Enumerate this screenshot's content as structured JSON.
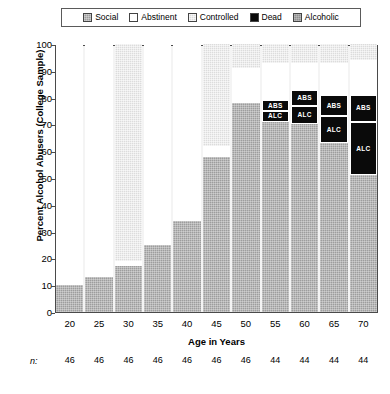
{
  "legend": {
    "items": [
      {
        "label": "Social",
        "key": "social",
        "color": "#9d9d9d"
      },
      {
        "label": "Abstinent",
        "key": "abstinent",
        "color": "#ffffff"
      },
      {
        "label": "Controlled",
        "key": "controlled",
        "color": "#dcdcdc"
      },
      {
        "label": "Dead",
        "key": "dead",
        "color": "#0a0a0a"
      },
      {
        "label": "Alcoholic",
        "key": "alcoholic",
        "color": "#8f8f8f"
      }
    ]
  },
  "axes": {
    "y_title": "Percent Alcohol Abusers (College Sample)",
    "x_title": "Age in Years",
    "y_ticks": [
      "100",
      "90",
      "80",
      "70",
      "60",
      "50",
      "40",
      "30",
      "20",
      "10",
      "0"
    ],
    "y_min": 0,
    "y_max": 100,
    "x_ticks": [
      "20",
      "25",
      "30",
      "35",
      "40",
      "45",
      "50",
      "55",
      "60",
      "65",
      "70"
    ]
  },
  "sample_sizes": {
    "prefix": "n:",
    "values": [
      "46",
      "46",
      "46",
      "46",
      "46",
      "46",
      "46",
      "44",
      "44",
      "44",
      "44"
    ]
  },
  "chart_data": {
    "type": "bar",
    "stacked": true,
    "title": "",
    "xlabel": "Age in Years",
    "ylabel": "Percent Alcohol Abusers (College Sample)",
    "ylim": [
      0,
      100
    ],
    "grid": false,
    "legend_position": "top",
    "categories": [
      "20",
      "25",
      "30",
      "35",
      "40",
      "45",
      "50",
      "55",
      "60",
      "65",
      "70"
    ],
    "series": [
      {
        "name": "Social",
        "values": [
          10,
          13,
          17,
          25,
          34,
          58,
          78,
          71,
          70,
          63,
          51
        ]
      },
      {
        "name": "Abstinent",
        "values": [
          90,
          87,
          2,
          75,
          66,
          4,
          13,
          14,
          10,
          12,
          13
        ]
      },
      {
        "name": "Controlled",
        "values": [
          0,
          0,
          81,
          0,
          0,
          38,
          9,
          7,
          7,
          7,
          6
        ]
      },
      {
        "name": "Dead (ABS)",
        "values": [
          0,
          0,
          0,
          0,
          0,
          0,
          0,
          4,
          6,
          8,
          10
        ]
      },
      {
        "name": "Dead (ALC)",
        "values": [
          0,
          0,
          0,
          0,
          0,
          0,
          0,
          4,
          7,
          10,
          20
        ]
      }
    ],
    "segment_labels": {
      "abstinent_dead": "ABS",
      "alcoholic_dead": "ALC"
    },
    "bars": [
      {
        "x": "20",
        "n": "46",
        "segments": [
          {
            "type": "social",
            "from": 0,
            "to": 10
          },
          {
            "type": "abstinent",
            "from": 10,
            "to": 100
          }
        ]
      },
      {
        "x": "25",
        "n": "46",
        "segments": [
          {
            "type": "social",
            "from": 0,
            "to": 13
          },
          {
            "type": "abstinent",
            "from": 13,
            "to": 100
          }
        ]
      },
      {
        "x": "30",
        "n": "46",
        "segments": [
          {
            "type": "social",
            "from": 0,
            "to": 17
          },
          {
            "type": "abstinent",
            "from": 17,
            "to": 19
          },
          {
            "type": "controlled",
            "from": 19,
            "to": 100
          }
        ]
      },
      {
        "x": "35",
        "n": "46",
        "segments": [
          {
            "type": "social",
            "from": 0,
            "to": 25
          },
          {
            "type": "abstinent",
            "from": 25,
            "to": 100
          }
        ]
      },
      {
        "x": "40",
        "n": "46",
        "segments": [
          {
            "type": "social",
            "from": 0,
            "to": 34
          },
          {
            "type": "abstinent",
            "from": 34,
            "to": 100
          }
        ]
      },
      {
        "x": "45",
        "n": "46",
        "segments": [
          {
            "type": "social",
            "from": 0,
            "to": 58
          },
          {
            "type": "abstinent",
            "from": 58,
            "to": 62
          },
          {
            "type": "controlled",
            "from": 62,
            "to": 100
          }
        ]
      },
      {
        "x": "50",
        "n": "46",
        "segments": [
          {
            "type": "social",
            "from": 0,
            "to": 78
          },
          {
            "type": "abstinent",
            "from": 78,
            "to": 91
          },
          {
            "type": "controlled",
            "from": 91,
            "to": 100
          }
        ]
      },
      {
        "x": "55",
        "n": "44",
        "segments": [
          {
            "type": "social",
            "from": 0,
            "to": 71
          },
          {
            "type": "dead",
            "from": 71,
            "to": 75,
            "label": "ALC"
          },
          {
            "type": "dead",
            "from": 75,
            "to": 79,
            "label": "ABS"
          },
          {
            "type": "abstinent",
            "from": 79,
            "to": 93
          },
          {
            "type": "controlled",
            "from": 93,
            "to": 100
          }
        ]
      },
      {
        "x": "60",
        "n": "44",
        "segments": [
          {
            "type": "social",
            "from": 0,
            "to": 70
          },
          {
            "type": "dead",
            "from": 70,
            "to": 77,
            "label": "ALC"
          },
          {
            "type": "dead",
            "from": 77,
            "to": 83,
            "label": "ABS"
          },
          {
            "type": "abstinent",
            "from": 83,
            "to": 93
          },
          {
            "type": "controlled",
            "from": 93,
            "to": 100
          }
        ]
      },
      {
        "x": "65",
        "n": "44",
        "segments": [
          {
            "type": "social",
            "from": 0,
            "to": 63
          },
          {
            "type": "dead",
            "from": 63,
            "to": 73,
            "label": "ALC"
          },
          {
            "type": "dead",
            "from": 73,
            "to": 81,
            "label": "ABS"
          },
          {
            "type": "abstinent",
            "from": 81,
            "to": 93
          },
          {
            "type": "controlled",
            "from": 93,
            "to": 100
          }
        ]
      },
      {
        "x": "70",
        "n": "44",
        "segments": [
          {
            "type": "social",
            "from": 0,
            "to": 51
          },
          {
            "type": "dead",
            "from": 51,
            "to": 71,
            "label": "ALC"
          },
          {
            "type": "dead",
            "from": 71,
            "to": 81,
            "label": "ABS"
          },
          {
            "type": "abstinent",
            "from": 81,
            "to": 94
          },
          {
            "type": "controlled",
            "from": 94,
            "to": 100
          }
        ]
      }
    ]
  }
}
